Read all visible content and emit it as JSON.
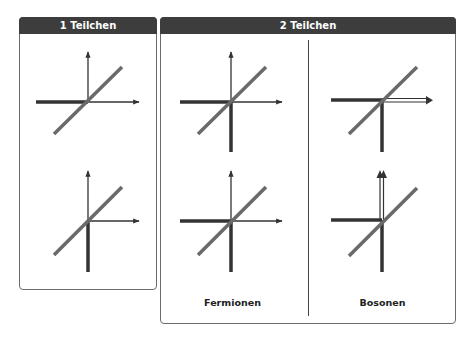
{
  "panels": {
    "single": {
      "title": "1 Teilchen"
    },
    "double": {
      "title": "2 Teilchen",
      "columns": [
        {
          "label": "Fermionen"
        },
        {
          "label": "Bosonen"
        }
      ]
    }
  },
  "colors": {
    "header_bg": "#3d3d3d",
    "axis": "#333333",
    "diagonal": "#6a6a6a",
    "thick_line": "#333333"
  }
}
